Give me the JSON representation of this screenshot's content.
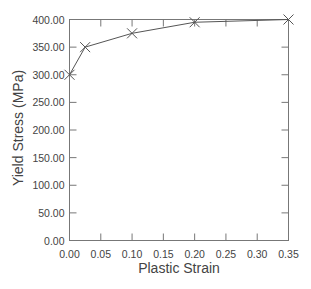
{
  "chart_data": {
    "type": "line",
    "title": "",
    "xlabel": "Plastic Strain",
    "ylabel": "Yield Stress (MPa)",
    "xlim": [
      0,
      0.35
    ],
    "ylim": [
      0,
      400
    ],
    "x_ticks": [
      "0.00",
      "0.05",
      "0.10",
      "0.15",
      "0.20",
      "0.25",
      "0.30",
      "0.35"
    ],
    "y_ticks": [
      "0.00",
      "50.00",
      "100.00",
      "150.00",
      "200.00",
      "250.00",
      "300.00",
      "350.00",
      "400.00"
    ],
    "grid": false,
    "legend": null,
    "series": [
      {
        "name": "Yield Stress",
        "marker": "x",
        "color": "#555555",
        "x": [
          0.0,
          0.025,
          0.1,
          0.2,
          0.35
        ],
        "y": [
          300,
          350,
          375,
          395,
          400
        ]
      }
    ]
  }
}
